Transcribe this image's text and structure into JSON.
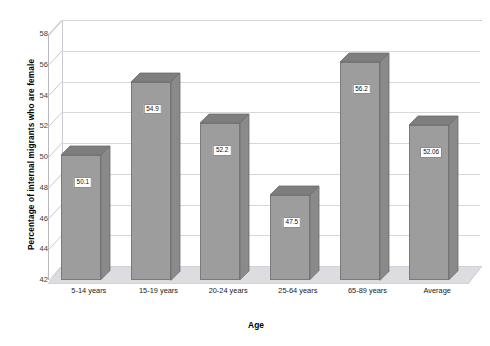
{
  "chart_data": {
    "type": "bar",
    "title": "",
    "xlabel": "Age",
    "ylabel": "Percentage of internal migrants who are female",
    "categories": [
      "5-14 years",
      "15-19 years",
      "20-24 years",
      "25-64 years",
      "65-89 years",
      "Average"
    ],
    "values": [
      50.1,
      54.9,
      52.2,
      47.5,
      56.2,
      52.06
    ],
    "data_labels": [
      "50.1",
      "54.9",
      "52.2",
      "47.5",
      "56.2",
      "52.06"
    ],
    "ylim": [
      42,
      58
    ],
    "yticks": [
      42,
      44,
      46,
      48,
      50,
      52,
      54,
      56,
      58
    ],
    "ytick_labels": [
      "42",
      "44",
      "46",
      "48",
      "50",
      "52",
      "54",
      "56",
      "58"
    ],
    "grid": true,
    "legend": "none",
    "series": [
      {
        "name": "Percentage female",
        "values": [
          50.1,
          54.9,
          52.2,
          47.5,
          56.2,
          52.06
        ]
      }
    ],
    "style": {
      "three_d": true,
      "bar_front_color": "#9d9d9d",
      "bar_top_color": "#7e7e7e",
      "bar_side_color": "#8a8a8a",
      "gridline_color": "#d6d6dc",
      "floor_color": "#dcdce1",
      "plot_background": "#ffffff"
    }
  }
}
